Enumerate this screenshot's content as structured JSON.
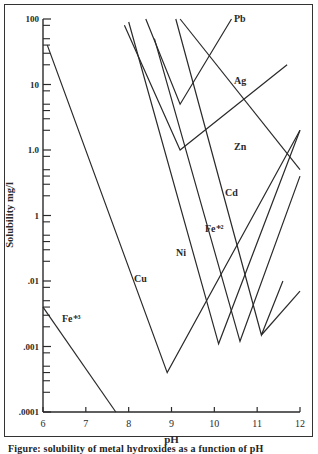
{
  "chart_data": {
    "type": "line",
    "title": "",
    "xlabel": "pH",
    "ylabel": "Solubility mg/l",
    "yscale": "log",
    "xlim": [
      6,
      12
    ],
    "ylim": [
      0.0001,
      100
    ],
    "x_ticks": [
      "6",
      "7",
      "8",
      "9",
      "10",
      "11",
      "12"
    ],
    "y_tick_labels": [
      "100",
      "10",
      "1.0",
      "1",
      ".01",
      ".001",
      ".0001"
    ],
    "y_tick_values": [
      100,
      10,
      1,
      0.1,
      0.01,
      0.001,
      0.0001
    ],
    "grid": false,
    "legend": "inline labels",
    "series": [
      {
        "name": "Pb",
        "label": "Pb",
        "points": [
          [
            8.4,
            100
          ],
          [
            9.2,
            5
          ],
          [
            10.4,
            100
          ]
        ]
      },
      {
        "name": "Ag",
        "label": "Ag",
        "points": [
          [
            9.2,
            100
          ],
          [
            12,
            0.5
          ]
        ]
      },
      {
        "name": "Zn",
        "label": "Zn",
        "points": [
          [
            7.9,
            80
          ],
          [
            9.2,
            1.0
          ],
          [
            11.7,
            20
          ]
        ]
      },
      {
        "name": "Cd",
        "label": "Cd",
        "points": [
          [
            9.1,
            100
          ],
          [
            11.1,
            0.0015
          ],
          [
            11.6,
            0.01
          ]
        ]
      },
      {
        "name": "Fe+2",
        "label": "Fe⁺²",
        "points": [
          [
            8.6,
            50
          ],
          [
            10.6,
            0.0012
          ],
          [
            12,
            0.4
          ]
        ]
      },
      {
        "name": "Ni",
        "label": "Ni",
        "points": [
          [
            8.0,
            90
          ],
          [
            10.1,
            0.0011
          ],
          [
            12,
            2
          ]
        ]
      },
      {
        "name": "Cu",
        "label": "Cu",
        "points": [
          [
            6.1,
            40
          ],
          [
            8.9,
            0.0004
          ],
          [
            12,
            2
          ]
        ]
      },
      {
        "name": "Fe+3",
        "label": "Fe⁺³",
        "points": [
          [
            6.0,
            0.004
          ],
          [
            7.7,
            0.0001
          ]
        ]
      },
      {
        "name": "extra-low",
        "label": "",
        "points": [
          [
            11.1,
            0.0015
          ],
          [
            12,
            0.007
          ]
        ]
      }
    ]
  },
  "caption": "Figure: solubility of metal hydroxides as a function of pH"
}
